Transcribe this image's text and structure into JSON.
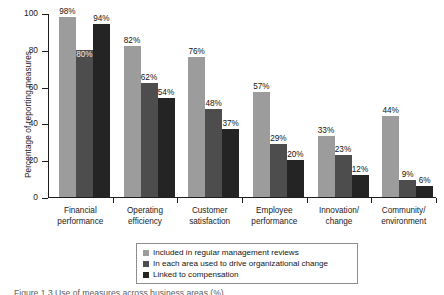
{
  "chart_data": {
    "type": "bar",
    "title": "",
    "xlabel": "",
    "ylabel": "Percentage of reporting measures",
    "ylim": [
      0,
      100
    ],
    "yticks": [
      0,
      20,
      40,
      60,
      80,
      100
    ],
    "grid": false,
    "legend_position": "bottom",
    "categories": [
      "Financial performance",
      "Operating efficiency",
      "Customer satisfaction",
      "Employee performance",
      "Innovation/ change",
      "Community/ environment"
    ],
    "category_lines": [
      [
        "Financial",
        "performance"
      ],
      [
        "Operating",
        "efficiency"
      ],
      [
        "Customer",
        "satisfaction"
      ],
      [
        "Employee",
        "performance"
      ],
      [
        "Innovation/",
        "change"
      ],
      [
        "Community/",
        "environment"
      ]
    ],
    "series": [
      {
        "name": "Included in regular management reviews",
        "color": "#9c9c9c",
        "values": [
          98,
          82,
          76,
          57,
          33,
          44
        ],
        "labels": [
          "98%",
          "82%",
          "76%",
          "57%",
          "33%",
          "44%"
        ]
      },
      {
        "name": "In each area used to drive organizational change",
        "color": "#4d4d4d",
        "values": [
          80,
          62,
          48,
          29,
          23,
          9
        ],
        "labels": [
          "80%",
          "62%",
          "48%",
          "29%",
          "23%",
          "9%"
        ]
      },
      {
        "name": "Linked to compensation",
        "color": "#242424",
        "values": [
          94,
          54,
          37,
          20,
          12,
          6
        ],
        "labels": [
          "94%",
          "54%",
          "37%",
          "20%",
          "12%",
          "6%"
        ]
      }
    ]
  },
  "axis": {
    "y_title": "Percentage of reporting measures",
    "y_tick_labels": [
      "0",
      "20",
      "40",
      "60",
      "80",
      "100"
    ]
  },
  "legend": {
    "items": [
      "Included in regular management reviews",
      "In each area used to drive organizational change",
      "Linked to compensation"
    ]
  },
  "caption": {
    "text": "Figure 1.3 Use of measures across business areas (%)"
  }
}
